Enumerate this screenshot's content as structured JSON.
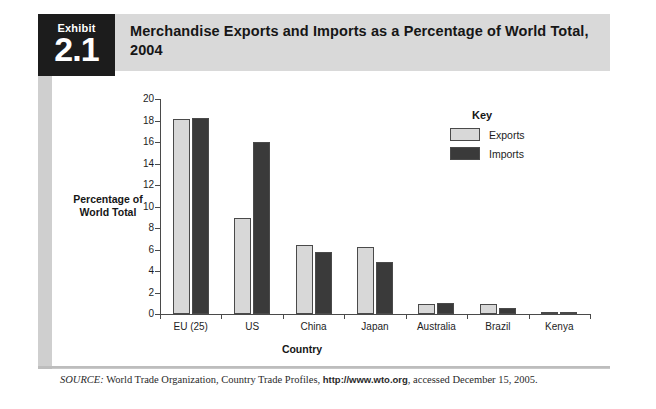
{
  "exhibit": {
    "word": "Exhibit",
    "number": "2.1"
  },
  "title": "Merchandise Exports and Imports as a Percentage of World Total, 2004",
  "legend": {
    "title": "Key",
    "items": [
      {
        "label": "Exports",
        "color": "#d8d8d8"
      },
      {
        "label": "Imports",
        "color": "#3a3a3a"
      }
    ]
  },
  "source": {
    "prefix": "SOURCE:",
    "body": " World Trade Organization, Country Trade Profiles, ",
    "url": "http://www.wto.org",
    "suffix": ", accessed December 15, 2005."
  },
  "chart_data": {
    "type": "bar",
    "title": "Merchandise Exports and Imports as a Percentage of World Total, 2004",
    "xlabel": "Country",
    "ylabel": "Percentage of World Total",
    "categories": [
      "EU (25)",
      "US",
      "China",
      "Japan",
      "Australia",
      "Brazil",
      "Kenya"
    ],
    "series": [
      {
        "name": "Exports",
        "color": "#d8d8d8",
        "values": [
          18.1,
          8.9,
          6.4,
          6.2,
          0.9,
          0.9,
          0.05
        ]
      },
      {
        "name": "Imports",
        "color": "#3a3a3a",
        "values": [
          18.2,
          16.0,
          5.8,
          4.8,
          1.0,
          0.6,
          0.05
        ]
      }
    ],
    "ylim": [
      0,
      20
    ],
    "yticks": [
      0,
      2,
      4,
      6,
      8,
      10,
      12,
      14,
      16,
      18,
      20
    ],
    "grid": false,
    "legend_position": "top-right"
  }
}
